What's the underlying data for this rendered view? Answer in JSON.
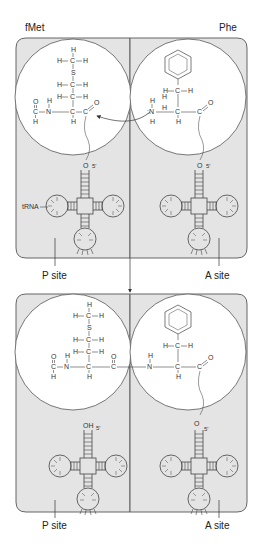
{
  "top": {
    "left_title": "fMet",
    "right_title": "Phe",
    "trna_label": "tRNA",
    "left_site": "P site",
    "right_site": "A site",
    "left_3prime_atom": "O",
    "right_3prime_atom": "O",
    "five_prime": "5'"
  },
  "bottom": {
    "left_site": "P site",
    "right_site": "A site",
    "left_3prime_atom": "OH",
    "right_3prime_atom": "O",
    "five_prime": "5'"
  },
  "colors": {
    "site_fill": "#e4e4e4",
    "site_stroke": "#555555",
    "circle_fill": "#ffffff",
    "line": "#444444"
  }
}
